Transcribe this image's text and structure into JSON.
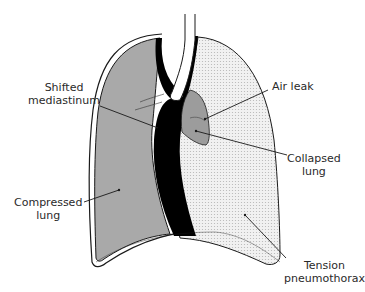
{
  "diagram": {
    "subject": "Tension pneumothorax",
    "labels": {
      "shifted_mediastinum": {
        "line1": "Shifted",
        "line2": "mediastinum"
      },
      "air_leak": {
        "line1": "Air leak"
      },
      "collapsed_lung": {
        "line1": "Collapsed",
        "line2": "lung"
      },
      "compressed_lung": {
        "line1": "Compressed",
        "line2": "lung"
      },
      "tension_pneumothorax": {
        "line1": "Tension",
        "line2": "pneumothorax"
      }
    },
    "colors": {
      "compressed_lung_fill": "#a9a9a9",
      "pneumothorax_fill": "#ececec",
      "collapsed_lung_fill": "#9c9c9c",
      "mediastinum_fill": "#000000",
      "outline": "#1a1a1a"
    }
  }
}
